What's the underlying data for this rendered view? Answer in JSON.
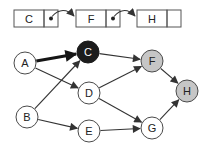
{
  "diagram": {
    "linked_list": {
      "y": 10,
      "height": 17,
      "data_width": 30,
      "pointer_width": 14,
      "cells": [
        {
          "label": "C",
          "x": 14,
          "has_next": true
        },
        {
          "label": "F",
          "x": 76,
          "has_next": true
        },
        {
          "label": "H",
          "x": 137,
          "has_next": false
        }
      ]
    },
    "graph": {
      "node_radius": 11,
      "nodes": [
        {
          "id": "A",
          "label": "A",
          "x": 25,
          "y": 63,
          "style": "plain"
        },
        {
          "id": "B",
          "label": "B",
          "x": 27,
          "y": 117,
          "style": "plain"
        },
        {
          "id": "C",
          "label": "C",
          "x": 88,
          "y": 52,
          "style": "filled-black"
        },
        {
          "id": "D",
          "label": "D",
          "x": 89,
          "y": 93,
          "style": "plain"
        },
        {
          "id": "E",
          "label": "E",
          "x": 89,
          "y": 131,
          "style": "plain"
        },
        {
          "id": "F",
          "label": "F",
          "x": 152,
          "y": 61,
          "style": "filled-gray"
        },
        {
          "id": "G",
          "label": "G",
          "x": 152,
          "y": 128,
          "style": "plain"
        },
        {
          "id": "H",
          "label": "H",
          "x": 187,
          "y": 91,
          "style": "filled-gray"
        }
      ],
      "edges": [
        {
          "from": "A",
          "to": "C",
          "thick": true
        },
        {
          "from": "A",
          "to": "D",
          "thick": false
        },
        {
          "from": "B",
          "to": "C",
          "thick": false
        },
        {
          "from": "B",
          "to": "E",
          "thick": false
        },
        {
          "from": "C",
          "to": "F",
          "thick": false
        },
        {
          "from": "D",
          "to": "F",
          "thick": false
        },
        {
          "from": "D",
          "to": "G",
          "thick": false
        },
        {
          "from": "E",
          "to": "G",
          "thick": false
        },
        {
          "from": "F",
          "to": "H",
          "thick": false
        },
        {
          "from": "G",
          "to": "H",
          "thick": false
        }
      ]
    },
    "colors": {
      "background": "#ffffff",
      "line": "#333333",
      "thick_line": "#151515",
      "box_border": "#555555",
      "node_plain_fill": "#ffffff",
      "node_black_fill": "#1c1c1c",
      "node_gray_fill": "#c6c6c6",
      "node_border": "#4a4a4a",
      "pointer_dot": "#222222",
      "text": "#222222",
      "text_on_black": "#ffffff"
    }
  }
}
